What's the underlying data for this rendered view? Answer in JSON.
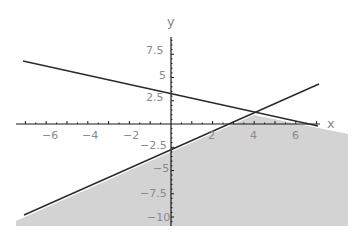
{
  "chart_data": {
    "type": "line",
    "title": "",
    "xlabel": "x",
    "ylabel": "y",
    "xlim": [
      -7.4,
      8.5
    ],
    "ylim": [
      -10.8,
      9
    ],
    "grid": false,
    "legend": null,
    "x_ticks": [
      -6,
      -4,
      -2,
      2,
      4,
      6
    ],
    "x_tick_labels": [
      "-6",
      "-4",
      "-2",
      "2",
      "4",
      "6"
    ],
    "y_ticks": [
      7.5,
      5,
      2.5,
      -2.5,
      -5,
      -7.5,
      -10
    ],
    "y_tick_labels": [
      "7.5",
      "5",
      "2.5",
      "-2.5",
      "-5",
      "-7.5",
      "-10"
    ],
    "series": [
      {
        "name": "y = 3 - x/2",
        "x": [
          -7.1,
          7.1
        ],
        "y": [
          6.55,
          -0.55
        ]
      },
      {
        "name": "y = x - 3",
        "x": [
          -7.1,
          7.1
        ],
        "y": [
          -10.1,
          4.1
        ]
      }
    ],
    "shaded_region": {
      "description": "region below both lines (y <= x - 3 and y <= 3 - x/2)",
      "vertices": [
        [
          -7.4,
          -10.8
        ],
        [
          -7.4,
          -10.4
        ],
        [
          4,
          1
        ],
        [
          8.5,
          -1.25
        ],
        [
          8.5,
          -10.8
        ]
      ],
      "color": "#d3d3d3"
    },
    "intersection": {
      "x": 4,
      "y": 1
    }
  },
  "labels": {
    "x_axis": "x",
    "y_axis": "y",
    "x_ticks": [
      "-6",
      "-4",
      "-2",
      "2",
      "4",
      "6"
    ],
    "y_ticks": [
      "7.5",
      "5",
      "2.5",
      "-2.5",
      "-5",
      "-7.5",
      "-10"
    ]
  },
  "colors": {
    "shade": "#d3d3d3",
    "line": "#2a2a2a",
    "axis": "#1a1a1a",
    "tick_text": "#8a8a8a"
  }
}
